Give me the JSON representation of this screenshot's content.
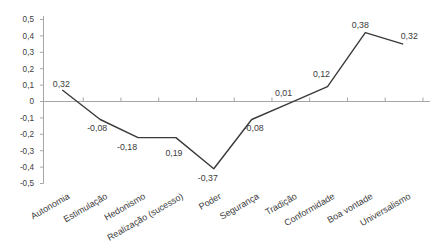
{
  "figure": {
    "background": "#ffffff"
  },
  "chart_data": {
    "type": "line",
    "title": "",
    "xlabel": "",
    "ylabel": "",
    "grid": false,
    "legend": "none",
    "decimal_separator": ",",
    "categories": [
      "Autonomia",
      "Estimulação",
      "Hedonismo",
      "Realização (sucesso)",
      "Poder",
      "Segurança",
      "Tradição",
      "Conformidade",
      "Boa vontade",
      "Universalismo"
    ],
    "values": [
      0.32,
      -0.08,
      -0.18,
      0.19,
      -0.37,
      -0.08,
      0.01,
      0.12,
      0.38,
      0.32
    ],
    "point_labels": [
      "0,32",
      "-0,08",
      "-0,18",
      "0,19",
      "-0,37",
      "-0,08",
      "0,01",
      "0,12",
      "0,38",
      "0,32"
    ],
    "plotted_values": [
      0.07,
      -0.11,
      -0.22,
      -0.22,
      -0.41,
      -0.11,
      -0.01,
      0.09,
      0.42,
      0.35
    ],
    "ylim": [
      -0.5,
      0.5
    ],
    "ytick_step": 0.1,
    "ytick_labels": [
      "0,5",
      "0,4",
      "0,3",
      "0,2",
      "0,1",
      "0",
      "-0,1",
      "-0,2",
      "-0,3",
      "-0,4",
      "-0,5"
    ],
    "colors": {
      "line": "#3a3a3a",
      "axis": "#a6a6a6",
      "text": "#3b3b3b",
      "background": "#ffffff"
    },
    "layout": {
      "width": 445,
      "height": 251,
      "axis_x": 43.5,
      "axis_top": 16,
      "axis_bottom": 183.5,
      "zero_y": 101.5,
      "px_per_unit": 164,
      "axis_right": 430,
      "cat_start": 62.3,
      "cat_step": 37.88,
      "xtick_start": 83.2,
      "xtick_step": 37.75,
      "ytick_len": 3.5,
      "xtick_len": 4,
      "ylabel_x": 34,
      "ylabel_font": 8.2,
      "point_label_font": 8.8,
      "cat_label_font": 9,
      "cat_label_y": 198,
      "cat_label_dx": 8,
      "cat_label_angle": -30,
      "label_offsets": [
        [
          -1,
          -3
        ],
        [
          -3,
          11
        ],
        [
          -11,
          12
        ],
        [
          -2,
          18
        ],
        [
          -6,
          12
        ],
        [
          2,
          11
        ],
        [
          -6,
          -7
        ],
        [
          -6,
          -10
        ],
        [
          -5,
          -5
        ],
        [
          6,
          -5
        ]
      ],
      "line_width": 1.4
    }
  }
}
